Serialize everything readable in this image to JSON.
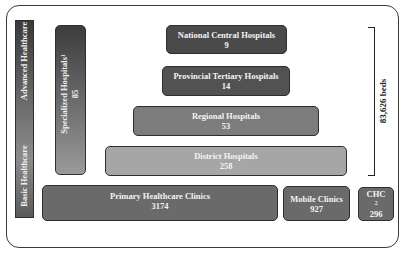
{
  "diagram": {
    "type": "healthcare-system-pyramid",
    "left_axis": {
      "top_label": "Advanced Healthcare",
      "bottom_label": "Basic Healthcare"
    },
    "specialized": {
      "label": "Specialized Hospitals",
      "footnote": "1",
      "count": "85"
    },
    "tiers": [
      {
        "label": "National Central Hospitals",
        "count": "9"
      },
      {
        "label": "Provincial Tertiary Hospitals",
        "count": "14"
      },
      {
        "label": "Regional Hospitals",
        "count": "53"
      },
      {
        "label": "District Hospitals",
        "count": "258"
      }
    ],
    "bottom_row": [
      {
        "label": "Primary Healthcare Clinics",
        "count": "3174"
      },
      {
        "label": "Mobile Clinics",
        "count": "927"
      },
      {
        "label": "CHC",
        "footnote": "2",
        "count": "296"
      }
    ],
    "bracket": {
      "label": "83,626 beds"
    },
    "colors": {
      "dark": "#4a4a4a",
      "mid": "#7c7c7c",
      "light": "#a6a6a6",
      "border": "#2e2e2e"
    }
  }
}
